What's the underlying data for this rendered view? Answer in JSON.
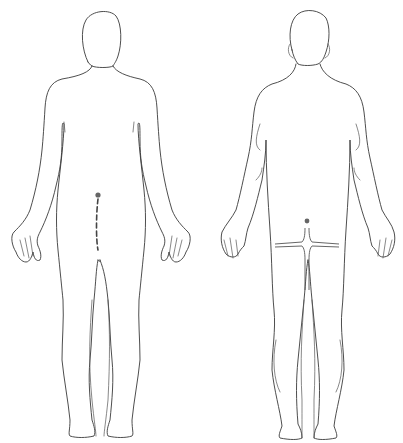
{
  "figures": [
    {
      "id": "front",
      "view": "anterior",
      "markings": [
        {
          "type": "dot",
          "label": "entry-point"
        },
        {
          "type": "dashed-line",
          "label": "incision-line"
        }
      ]
    },
    {
      "id": "back",
      "view": "posterior",
      "markings": [
        {
          "type": "dot",
          "label": "entry-point"
        },
        {
          "type": "t-shaped-line",
          "label": "incision-line"
        }
      ]
    }
  ],
  "colors": {
    "background": "#ffffff",
    "outline": "#3a3a3a",
    "marking": "#666666"
  }
}
